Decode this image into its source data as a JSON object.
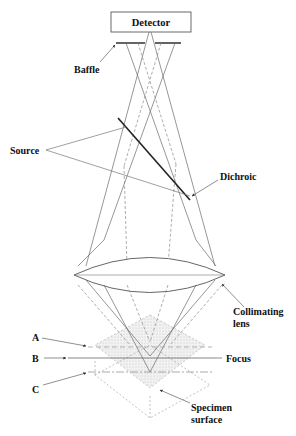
{
  "diagram": {
    "components": {
      "detector": "Detector",
      "baffle": "Baffle",
      "source": "Source",
      "dichroic": "Dichroic",
      "collimating_lens_line1": "Collimating",
      "collimating_lens_line2": "lens",
      "focus": "Focus",
      "specimen_line1": "Specimen",
      "specimen_line2": "surface"
    },
    "planes": {
      "a": "A",
      "b": "B",
      "c": "C"
    },
    "colors": {
      "ink": "#111111",
      "ray": "#6a6a6a",
      "specimen_fill": "#e4e4e4"
    }
  }
}
